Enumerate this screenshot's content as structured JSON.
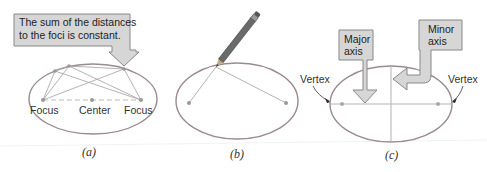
{
  "panel_a": {
    "callout": [
      "The sum of the distances",
      "to the foci is constant."
    ],
    "left_label": "Focus",
    "center_label": "Center",
    "right_label": "Focus",
    "caption": "(a)"
  },
  "panel_b": {
    "caption": "(b)"
  },
  "panel_c": {
    "major_axis_label": [
      "Major",
      "axis"
    ],
    "minor_axis_label": [
      "Minor",
      "axis"
    ],
    "left_vertex_label": "Vertex",
    "right_vertex_label": "Vertex",
    "caption": "(c)"
  },
  "colors": {
    "ellipse": "#9a8a92",
    "lines": "#a0a0a0",
    "callout_fill": "#d6d6d6",
    "callout_stroke": "#888888",
    "dot": "#999999"
  }
}
